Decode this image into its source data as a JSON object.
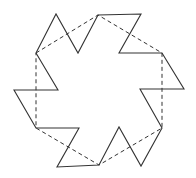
{
  "figure": {
    "stroke_color": "#333333",
    "dash_color": "#333333",
    "star_polygon": [
      [
        36,
        53
      ],
      [
        56,
        14
      ],
      [
        78,
        53
      ],
      [
        98,
        15
      ],
      [
        141,
        14
      ],
      [
        119,
        53
      ],
      [
        162,
        53
      ],
      [
        184,
        89
      ],
      [
        140,
        89
      ],
      [
        162,
        128
      ],
      [
        141,
        166
      ],
      [
        119,
        127
      ],
      [
        99,
        165
      ],
      [
        57,
        167
      ],
      [
        79,
        128
      ],
      [
        36,
        128
      ],
      [
        14,
        90
      ],
      [
        58,
        90
      ]
    ],
    "dashed_hexagon": [
      [
        36,
        53
      ],
      [
        98,
        15
      ],
      [
        162,
        53
      ],
      [
        162,
        128
      ],
      [
        99,
        165
      ],
      [
        36,
        128
      ]
    ]
  }
}
